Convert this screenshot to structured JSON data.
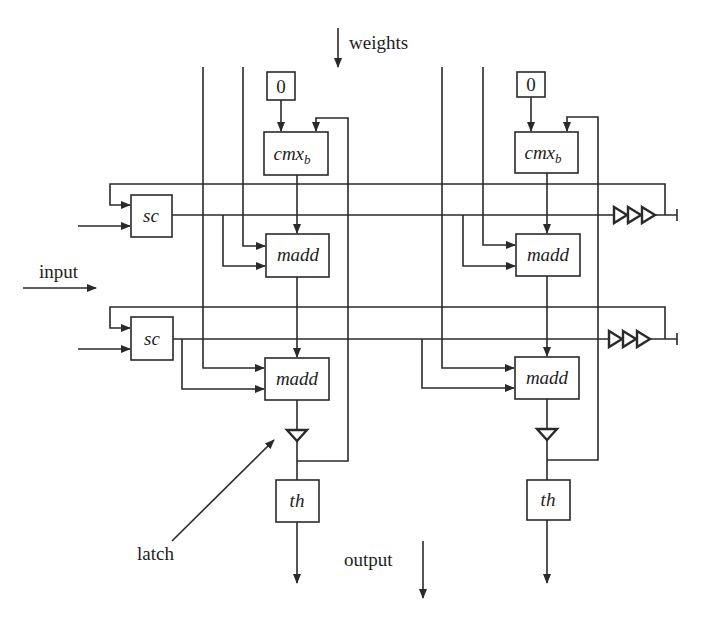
{
  "diagram": {
    "type": "systolic-array-datapath",
    "labels": {
      "weights": "weights",
      "input": "input",
      "latch": "latch",
      "output": "output"
    },
    "columns": [
      {
        "id": "col-1",
        "constant": "0",
        "accumulator": {
          "text": "cmx",
          "subscript": "b"
        },
        "rows": [
          {
            "unit": "madd"
          },
          {
            "unit": "madd"
          }
        ],
        "threshold": "th"
      },
      {
        "id": "col-2",
        "constant": "0",
        "accumulator": {
          "text": "cmx",
          "subscript": "b"
        },
        "rows": [
          {
            "unit": "madd"
          },
          {
            "unit": "madd"
          }
        ],
        "threshold": "th"
      }
    ],
    "row_units": [
      {
        "id": "row-1",
        "shifter": "sc",
        "delay_stages": 3
      },
      {
        "id": "row-2",
        "shifter": "sc",
        "delay_stages": 3
      }
    ],
    "colors": {
      "line": "#2a2a2a",
      "text": "#1e1e1e",
      "background": "#ffffff"
    }
  }
}
